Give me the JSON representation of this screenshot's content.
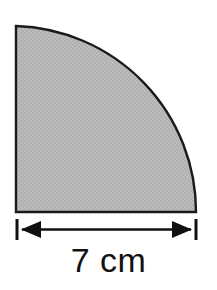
{
  "figure": {
    "kind": "quarter-circle-geometry-diagram",
    "shape_name": "quarter-circle",
    "background_color": "#ffffff",
    "fill_color": "#b8b8b8",
    "fill_texture": "dither-halftone",
    "outline_color": "#1a1a1a",
    "outline_width": 2,
    "geometry": {
      "corner_x": 16,
      "corner_y": 212,
      "radius": 180,
      "top_x": 16,
      "top_y": 26,
      "right_x": 196,
      "right_y": 212
    }
  },
  "dimension": {
    "label": "7 cm",
    "value": 7,
    "unit": "cm",
    "measures": "radius",
    "line_color": "#111111",
    "line_y": 229,
    "start_x": 16,
    "end_x": 196,
    "tick_top_y": 219,
    "tick_bottom_y": 240,
    "arrow_style": "double-headed",
    "label_color": "#121212"
  }
}
